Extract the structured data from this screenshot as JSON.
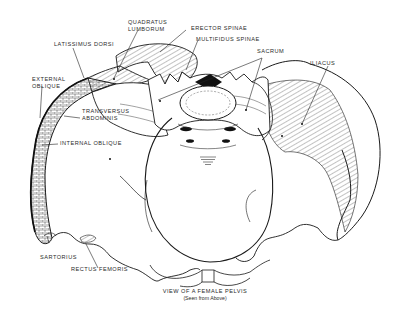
{
  "diagram": {
    "caption": "VIEW OF A FEMALE PELVIS",
    "subcaption": "(Seen from Above)",
    "labels": {
      "quadratus_lumborum_1": "QUADRATUS",
      "quadratus_lumborum_2": "LUMBORUM",
      "erector_spinae": "ERECTOR SPINAE",
      "multifidus_spinae": "MULTIFIDUS SPINAE",
      "latissimus_dorsi": "LATISSIMUS DORSI",
      "sacrum": "SACRUM",
      "iliacus": "ILIACUS",
      "external_oblique_1": "EXTERNAL",
      "external_oblique_2": "OBLIQUE",
      "transversus_abdominis_1": "TRANSVERSUS",
      "transversus_abdominis_2": "ABDOMINIS",
      "internal_oblique": "INTERNAL OBLIQUE",
      "sartorius": "SARTORIUS",
      "rectus_femoris": "RECTUS FEMORIS"
    },
    "colors": {
      "line": "#1a1a1a",
      "background": "#ffffff"
    }
  }
}
